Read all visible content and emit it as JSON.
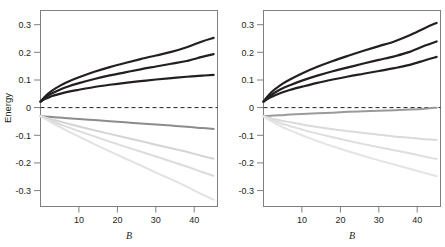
{
  "figure": {
    "background": "#ffffff",
    "panel_count": 2
  },
  "chart_data": [
    {
      "panel": "left",
      "type": "line",
      "title": "",
      "xlabel": "B",
      "ylabel": "Energy",
      "xlim": [
        0,
        46
      ],
      "ylim": [
        -0.355,
        0.355
      ],
      "xticks": [
        10,
        20,
        30,
        40
      ],
      "xticklabels": [
        "10",
        "20",
        "30",
        "40"
      ],
      "yticks": [
        0.3,
        0.2,
        0.1,
        0,
        -0.1,
        -0.2,
        -0.3
      ],
      "yticklabels": [
        "0.3",
        "0.2",
        "0.1",
        "0",
        "-0.1",
        "-0.2",
        "-0.3"
      ],
      "grid": false,
      "legend": "none",
      "zero_line": {
        "value": 0,
        "style": "dashed",
        "color": "#231f20"
      },
      "x": [
        0,
        1,
        2,
        3,
        5,
        7,
        10,
        14,
        18,
        22,
        26,
        30,
        34,
        38,
        42,
        45
      ],
      "series": [
        {
          "name": "upper-black",
          "color": "#231f20",
          "width": 2.2,
          "values": [
            0.025,
            0.041,
            0.054,
            0.065,
            0.082,
            0.096,
            0.113,
            0.133,
            0.15,
            0.165,
            0.179,
            0.192,
            0.205,
            0.222,
            0.243,
            0.256
          ]
        },
        {
          "name": "middle-black",
          "color": "#231f20",
          "width": 2.2,
          "values": [
            0.025,
            0.037,
            0.047,
            0.055,
            0.068,
            0.079,
            0.092,
            0.107,
            0.12,
            0.131,
            0.142,
            0.152,
            0.162,
            0.172,
            0.187,
            0.197
          ]
        },
        {
          "name": "lower-black",
          "color": "#231f20",
          "width": 2.2,
          "values": [
            0.025,
            0.033,
            0.039,
            0.045,
            0.053,
            0.06,
            0.068,
            0.078,
            0.086,
            0.093,
            0.099,
            0.105,
            0.11,
            0.115,
            0.119,
            0.122
          ]
        },
        {
          "name": "upper-gray",
          "color": "#8c8c8c",
          "width": 2.0,
          "values": [
            -0.028,
            -0.029,
            -0.03,
            -0.031,
            -0.033,
            -0.035,
            -0.038,
            -0.042,
            -0.046,
            -0.05,
            -0.054,
            -0.058,
            -0.062,
            -0.066,
            -0.071,
            -0.074
          ]
        },
        {
          "name": "middle-lightgray",
          "color": "#d4d4d4",
          "width": 2.0,
          "values": [
            -0.028,
            -0.032,
            -0.036,
            -0.04,
            -0.047,
            -0.054,
            -0.065,
            -0.079,
            -0.092,
            -0.105,
            -0.118,
            -0.131,
            -0.144,
            -0.157,
            -0.172,
            -0.182
          ]
        },
        {
          "name": "middle2-lightgray",
          "color": "#dcdcdc",
          "width": 2.0,
          "values": [
            -0.028,
            -0.034,
            -0.04,
            -0.046,
            -0.057,
            -0.067,
            -0.082,
            -0.101,
            -0.12,
            -0.138,
            -0.156,
            -0.174,
            -0.192,
            -0.21,
            -0.23,
            -0.244
          ]
        },
        {
          "name": "lower-lightgray",
          "color": "#e2e2e2",
          "width": 2.0,
          "values": [
            -0.028,
            -0.036,
            -0.044,
            -0.052,
            -0.067,
            -0.081,
            -0.102,
            -0.129,
            -0.155,
            -0.181,
            -0.206,
            -0.232,
            -0.257,
            -0.283,
            -0.311,
            -0.33
          ]
        }
      ]
    },
    {
      "panel": "right",
      "type": "line",
      "title": "",
      "xlabel": "B",
      "ylabel": "",
      "xlim": [
        0,
        46
      ],
      "ylim": [
        -0.355,
        0.355
      ],
      "xticks": [
        10,
        20,
        30,
        40
      ],
      "xticklabels": [
        "10",
        "20",
        "30",
        "40"
      ],
      "yticks": [
        0.3,
        0.2,
        0.1,
        0,
        -0.1,
        -0.2,
        -0.3
      ],
      "yticklabels": [
        "0.3",
        "0.2",
        "0.1",
        "0",
        "-0.1",
        "-0.2",
        "-0.3"
      ],
      "grid": false,
      "legend": "none",
      "zero_line": {
        "value": 0,
        "style": "dashed",
        "color": "#231f20"
      },
      "x": [
        0,
        1,
        2,
        3,
        5,
        7,
        10,
        14,
        18,
        22,
        26,
        30,
        34,
        38,
        42,
        45
      ],
      "series": [
        {
          "name": "upper-black",
          "color": "#231f20",
          "width": 2.2,
          "values": [
            0.025,
            0.043,
            0.058,
            0.07,
            0.09,
            0.106,
            0.127,
            0.151,
            0.172,
            0.191,
            0.209,
            0.226,
            0.243,
            0.265,
            0.292,
            0.31
          ]
        },
        {
          "name": "middle-black",
          "color": "#231f20",
          "width": 2.2,
          "values": [
            0.025,
            0.038,
            0.049,
            0.058,
            0.073,
            0.085,
            0.101,
            0.119,
            0.135,
            0.149,
            0.163,
            0.176,
            0.189,
            0.205,
            0.228,
            0.243
          ]
        },
        {
          "name": "lower-black",
          "color": "#231f20",
          "width": 2.2,
          "values": [
            0.025,
            0.034,
            0.042,
            0.048,
            0.059,
            0.068,
            0.079,
            0.093,
            0.105,
            0.116,
            0.126,
            0.136,
            0.146,
            0.158,
            0.175,
            0.187
          ]
        },
        {
          "name": "rising-gray",
          "color": "#9a9a9a",
          "width": 2.0,
          "values": [
            -0.028,
            -0.027,
            -0.026,
            -0.025,
            -0.024,
            -0.022,
            -0.02,
            -0.017,
            -0.015,
            -0.012,
            -0.01,
            -0.008,
            -0.006,
            -0.004,
            -0.001,
            0.003
          ]
        },
        {
          "name": "upper-lightgray",
          "color": "#dadada",
          "width": 2.0,
          "values": [
            -0.028,
            -0.032,
            -0.036,
            -0.039,
            -0.045,
            -0.05,
            -0.058,
            -0.067,
            -0.075,
            -0.082,
            -0.089,
            -0.095,
            -0.101,
            -0.106,
            -0.111,
            -0.114
          ]
        },
        {
          "name": "middle-lightgray",
          "color": "#dedede",
          "width": 2.0,
          "values": [
            -0.028,
            -0.035,
            -0.041,
            -0.046,
            -0.056,
            -0.064,
            -0.076,
            -0.091,
            -0.104,
            -0.117,
            -0.129,
            -0.14,
            -0.151,
            -0.162,
            -0.175,
            -0.183
          ]
        },
        {
          "name": "lower-lightgray",
          "color": "#e4e4e4",
          "width": 2.0,
          "values": [
            -0.028,
            -0.038,
            -0.046,
            -0.054,
            -0.068,
            -0.08,
            -0.097,
            -0.118,
            -0.137,
            -0.155,
            -0.172,
            -0.188,
            -0.203,
            -0.218,
            -0.234,
            -0.245
          ]
        }
      ]
    }
  ],
  "axes": {
    "frame_color": "#7f7f7f",
    "tick_color": "#7f7f7f",
    "text_color": "#231f20"
  }
}
